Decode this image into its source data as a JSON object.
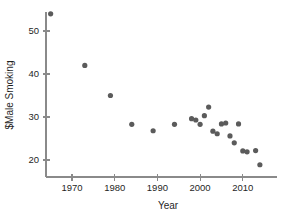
{
  "chart_data": {
    "type": "scatter",
    "title": "",
    "xlabel": "Year",
    "ylabel": "$Male Smoking",
    "xlim": [
      1963,
      2017
    ],
    "ylim": [
      17.5,
      55.5
    ],
    "xticks": [
      1970,
      1980,
      1990,
      2000,
      2010
    ],
    "xtick_labels": [
      "1970",
      "1980",
      "1990",
      "2000",
      "2010"
    ],
    "yticks": [
      20,
      30,
      40,
      50
    ],
    "ytick_labels": [
      "20",
      "30",
      "40",
      "50"
    ],
    "grid": false,
    "legend": false,
    "marker": {
      "shape": "circle",
      "color": "#5b5b5b",
      "radius_px": 2.6
    },
    "series": [
      {
        "name": "Male Smoking",
        "points": [
          {
            "x": 1965,
            "y": 54.0
          },
          {
            "x": 1973,
            "y": 42.0
          },
          {
            "x": 1979,
            "y": 35.0
          },
          {
            "x": 1984,
            "y": 28.3
          },
          {
            "x": 1989,
            "y": 26.8
          },
          {
            "x": 1994,
            "y": 28.3
          },
          {
            "x": 1998,
            "y": 29.6
          },
          {
            "x": 1999,
            "y": 29.3
          },
          {
            "x": 2000,
            "y": 28.3
          },
          {
            "x": 2001,
            "y": 30.3
          },
          {
            "x": 2002,
            "y": 32.3
          },
          {
            "x": 2003,
            "y": 26.7
          },
          {
            "x": 2004,
            "y": 26.1
          },
          {
            "x": 2005,
            "y": 28.4
          },
          {
            "x": 2006,
            "y": 28.6
          },
          {
            "x": 2007,
            "y": 25.6
          },
          {
            "x": 2008,
            "y": 24.0
          },
          {
            "x": 2009,
            "y": 28.4
          },
          {
            "x": 2010,
            "y": 22.1
          },
          {
            "x": 2011,
            "y": 21.9
          },
          {
            "x": 2013,
            "y": 22.2
          },
          {
            "x": 2014,
            "y": 18.9
          }
        ]
      }
    ]
  },
  "geometry": {
    "x_axis_pixels": {
      "x_at_1970": 72,
      "px_per_year": 4.27,
      "axis_y": 177,
      "axis_x_start": 46,
      "axis_x_end": 277
    },
    "y_axis_pixels": {
      "y_at_50": 31,
      "px_per_unit": 4.3,
      "axis_x": 46,
      "axis_y_start": 12,
      "axis_y_end": 177
    }
  }
}
